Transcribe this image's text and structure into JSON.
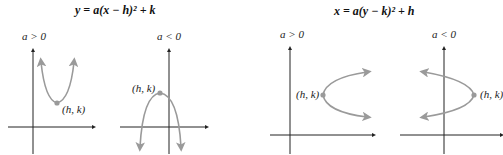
{
  "diagram": {
    "left_group": {
      "equation": "y = a(x − h)² + k",
      "panels": [
        {
          "condition": "a > 0",
          "vertex_label": "(h, k)",
          "opens": "up"
        },
        {
          "condition": "a < 0",
          "vertex_label": "(h, k)",
          "opens": "down"
        }
      ]
    },
    "right_group": {
      "equation": "x = a(y − k)² + h",
      "panels": [
        {
          "condition": "a > 0",
          "vertex_label": "(h, k)",
          "opens": "right"
        },
        {
          "condition": "a < 0",
          "vertex_label": "(h, k)",
          "opens": "left"
        }
      ]
    },
    "colors": {
      "axis": "#222222",
      "curve": "#9a9a9a",
      "text": "#111111"
    }
  }
}
